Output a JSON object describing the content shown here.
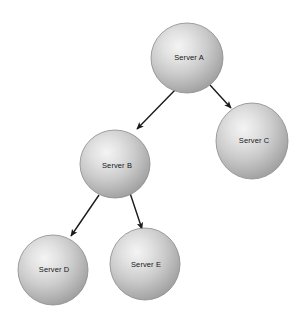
{
  "diagram": {
    "type": "node-link-graph",
    "background_color": "#ffffff",
    "width": 302,
    "height": 316,
    "node_style": {
      "shape": "sphere",
      "fill_highlight_color": "#f2f2f2",
      "fill_mid_color": "#c9c9c9",
      "fill_edge_color": "#9a9a9a",
      "outline_color": "#8a8a8a",
      "label_color": "#16181a",
      "label_font_size": "7.5px"
    },
    "edge_style": {
      "line_color": "#1a1a1a",
      "line_width": 1.4,
      "arrowhead": "solid-triangle"
    },
    "nodes": [
      {
        "id": "A",
        "label": "Server A",
        "cx": 187,
        "cy": 58,
        "rx": 36,
        "ry": 35,
        "label_cx": 189,
        "label_cy": 58
      },
      {
        "id": "C",
        "label": "Server C",
        "cx": 252,
        "cy": 141,
        "rx": 36,
        "ry": 38,
        "label_cx": 254,
        "label_cy": 141
      },
      {
        "id": "B",
        "label": "Server B",
        "cx": 115,
        "cy": 164,
        "rx": 35,
        "ry": 34,
        "label_cx": 117,
        "label_cy": 166
      },
      {
        "id": "D",
        "label": "Server D",
        "cx": 53,
        "cy": 270,
        "rx": 35,
        "ry": 35,
        "label_cx": 54,
        "label_cy": 270
      },
      {
        "id": "E",
        "label": "Server E",
        "cx": 145,
        "cy": 264,
        "rx": 35,
        "ry": 36,
        "label_cx": 146,
        "label_cy": 265
      }
    ],
    "edges": [
      {
        "id": "a-b",
        "from": "A",
        "to": "B",
        "x1": 176,
        "y1": 89,
        "x2": 137,
        "y2": 129
      },
      {
        "id": "a-c",
        "from": "A",
        "to": "C",
        "x1": 210,
        "y1": 85,
        "x2": 231,
        "y2": 108
      },
      {
        "id": "b-d",
        "from": "B",
        "to": "D",
        "x1": 99,
        "y1": 195,
        "x2": 71,
        "y2": 236
      },
      {
        "id": "b-e",
        "from": "B",
        "to": "E",
        "x1": 130,
        "y1": 193,
        "x2": 142,
        "y2": 229
      }
    ]
  }
}
